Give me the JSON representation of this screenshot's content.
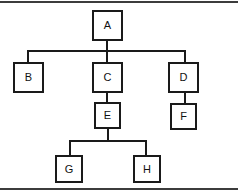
{
  "diagram": {
    "type": "tree",
    "background_color": "#ffffff",
    "line_color": "#1a1a1a",
    "node_fill_color": "#ffffff",
    "frame_color": "#3c3c3c",
    "nodes": [
      {
        "id": "A",
        "label": "A",
        "x": 92,
        "y": 10,
        "w": 31,
        "h": 31
      },
      {
        "id": "B",
        "label": "B",
        "x": 13,
        "y": 62,
        "w": 31,
        "h": 31
      },
      {
        "id": "C",
        "label": "C",
        "x": 92,
        "y": 62,
        "w": 31,
        "h": 31
      },
      {
        "id": "D",
        "label": "D",
        "x": 168,
        "y": 62,
        "w": 31,
        "h": 31
      },
      {
        "id": "E",
        "label": "E",
        "x": 94,
        "y": 102,
        "w": 27,
        "h": 27
      },
      {
        "id": "F",
        "label": "F",
        "x": 170,
        "y": 103,
        "w": 27,
        "h": 27
      },
      {
        "id": "G",
        "label": "G",
        "x": 55,
        "y": 155,
        "w": 28,
        "h": 28
      },
      {
        "id": "H",
        "label": "H",
        "x": 133,
        "y": 155,
        "w": 28,
        "h": 28
      }
    ],
    "edges": [
      {
        "from": "A",
        "to": "B"
      },
      {
        "from": "A",
        "to": "C"
      },
      {
        "from": "A",
        "to": "D"
      },
      {
        "from": "C",
        "to": "E"
      },
      {
        "from": "D",
        "to": "F"
      },
      {
        "from": "E",
        "to": "G"
      },
      {
        "from": "E",
        "to": "H"
      }
    ],
    "segments": [
      {
        "name": "a-stem-down",
        "orient": "v",
        "x": 106,
        "y": 41,
        "len": 10
      },
      {
        "name": "level1-bus",
        "orient": "h",
        "x": 27,
        "y": 50,
        "len": 159
      },
      {
        "name": "bus-to-b",
        "orient": "v",
        "x": 27,
        "y": 50,
        "len": 12
      },
      {
        "name": "bus-to-c",
        "orient": "v",
        "x": 106,
        "y": 50,
        "len": 12
      },
      {
        "name": "bus-to-d",
        "orient": "v",
        "x": 184,
        "y": 50,
        "len": 12
      },
      {
        "name": "c-to-e",
        "orient": "v",
        "x": 106,
        "y": 93,
        "len": 10
      },
      {
        "name": "d-to-f",
        "orient": "v",
        "x": 184,
        "y": 93,
        "len": 11
      },
      {
        "name": "e-stem-down",
        "orient": "v",
        "x": 107,
        "y": 129,
        "len": 12
      },
      {
        "name": "level3-bus",
        "orient": "h",
        "x": 69,
        "y": 140,
        "len": 78
      },
      {
        "name": "bus-to-g",
        "orient": "v",
        "x": 69,
        "y": 140,
        "len": 15
      },
      {
        "name": "bus-to-h",
        "orient": "v",
        "x": 145,
        "y": 140,
        "len": 15
      }
    ]
  }
}
